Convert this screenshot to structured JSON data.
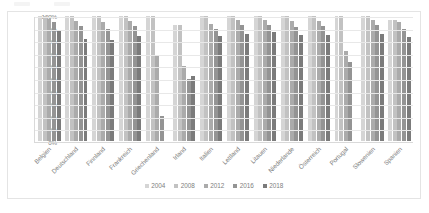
{
  "chart_data": {
    "type": "bar",
    "title": "",
    "subtitle": "",
    "xlabel": "",
    "ylabel": "",
    "ylim": [
      0,
      100
    ],
    "y_unit": "%",
    "grid": true,
    "legend_position": "bottom",
    "categories": [
      "Belgien",
      "Deutschland",
      "Finnland",
      "Frankreich",
      "Griechenland",
      "Irland",
      "Italien",
      "Lettland",
      "Litauen",
      "Niederlande",
      "Österreich",
      "Portugal",
      "Slowenien",
      "Spanien"
    ],
    "ytick_labels": [
      "100%",
      "90%",
      "80%",
      "70%",
      "60%",
      "50%",
      "40%",
      "30%",
      "20%",
      "10%",
      "0%"
    ],
    "ytick_values": [
      100,
      90,
      80,
      70,
      60,
      50,
      40,
      30,
      20,
      10,
      0
    ],
    "series": [
      {
        "name": "2004",
        "color": "#d5d5d5",
        "values": [
          100,
          100,
          100,
          100,
          100,
          93,
          100,
          100,
          100,
          100,
          100,
          100,
          100,
          97
        ]
      },
      {
        "name": "2008",
        "color": "#c2c2c2",
        "values": [
          100,
          100,
          100,
          100,
          100,
          93,
          100,
          100,
          100,
          100,
          100,
          100,
          100,
          97
        ]
      },
      {
        "name": "2012",
        "color": "#ababab",
        "values": [
          98,
          96,
          95,
          96,
          68,
          60,
          94,
          97,
          97,
          96,
          96,
          72,
          97,
          95
        ]
      },
      {
        "name": "2016",
        "color": "#949494",
        "values": [
          95,
          92,
          90,
          92,
          20,
          50,
          90,
          93,
          93,
          91,
          92,
          63,
          93,
          90
        ]
      },
      {
        "name": "2018",
        "color": "#7b7b7b",
        "values": [
          88,
          82,
          81,
          84,
          0,
          52,
          84,
          86,
          87,
          85,
          85,
          0,
          86,
          83
        ]
      }
    ]
  }
}
